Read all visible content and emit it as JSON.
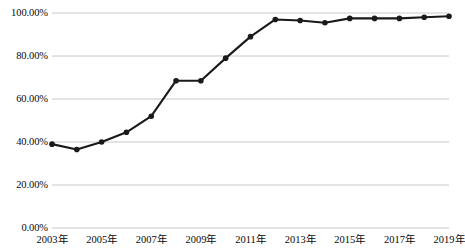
{
  "chart_data": {
    "type": "line",
    "title": "",
    "subtitle": "",
    "xlabel": "",
    "ylabel": "",
    "x": [
      2003,
      2004,
      2005,
      2006,
      2007,
      2008,
      2009,
      2010,
      2011,
      2012,
      2013,
      2014,
      2015,
      2016,
      2017,
      2018,
      2019
    ],
    "categories": [
      "2003年",
      "2004年",
      "2005年",
      "2006年",
      "2007年",
      "2008年",
      "2009年",
      "2010年",
      "2011年",
      "2012年",
      "2013年",
      "2014年",
      "2015年",
      "2016年",
      "2017年",
      "2018年",
      "2019年"
    ],
    "values": [
      39.0,
      36.5,
      40.0,
      44.5,
      52.0,
      68.5,
      68.5,
      79.0,
      89.0,
      97.0,
      96.5,
      95.5,
      97.5,
      97.5,
      97.5,
      98.0,
      98.5
    ],
    "series": [
      {
        "name": "",
        "values": [
          39.0,
          36.5,
          40.0,
          44.5,
          52.0,
          68.5,
          68.5,
          79.0,
          89.0,
          97.0,
          96.5,
          95.5,
          97.5,
          97.5,
          97.5,
          98.0,
          98.5
        ]
      }
    ],
    "ylim": [
      0,
      100
    ],
    "yticks": [
      0,
      20,
      40,
      60,
      80,
      100
    ],
    "ytick_labels": [
      "0.00%",
      "20.00%",
      "40.00%",
      "60.00%",
      "80.00%",
      "100.00%"
    ],
    "xtick_labels_shown": [
      "2003年",
      "2005年",
      "2007年",
      "2009年",
      "2011年",
      "2013年",
      "2015年",
      "2017年",
      "2019年"
    ],
    "xtick_values_shown": [
      2003,
      2005,
      2007,
      2009,
      2011,
      2013,
      2015,
      2017,
      2019
    ],
    "grid": true,
    "grid_axis": "y",
    "legend": false,
    "legend_position": "none",
    "markers": true,
    "marker_shape": "circle",
    "line_color": "#1a1a1a",
    "marker_color": "#1a1a1a",
    "grid_color": "#c8c8c8",
    "background_color": "#ffffff",
    "annotations": []
  },
  "axes": {
    "plot_left": 52,
    "plot_right": 449,
    "plot_top": 13,
    "plot_bottom": 228
  }
}
